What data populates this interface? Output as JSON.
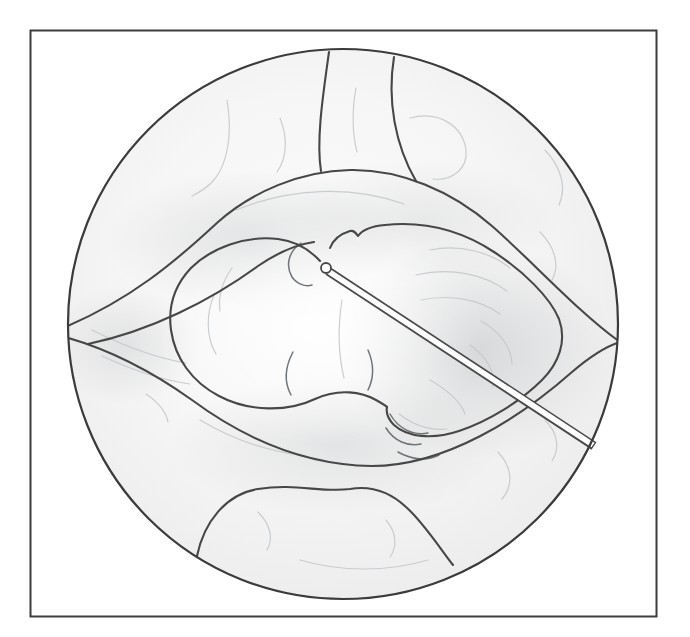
{
  "figure": {
    "kind": "medical-line-illustration",
    "visible_text": "",
    "elements": [
      {
        "name": "outer-frame",
        "role": "figure border rectangle"
      },
      {
        "name": "endoscopic-field-circle",
        "role": "circular scope field of view"
      },
      {
        "name": "peripheral-bowel-loops",
        "role": "lobulated tissue around the field periphery"
      },
      {
        "name": "tissue-ring",
        "role": "oval tissue band surrounding the central organ"
      },
      {
        "name": "central-organ-left-lobe",
        "role": "smooth left lobe of central organ"
      },
      {
        "name": "central-organ-right-lobe",
        "role": "textured right lobe of central organ"
      },
      {
        "name": "puncture-needle",
        "role": "thin instrument shaft entering from lower right"
      },
      {
        "name": "needle-tip",
        "role": "rounded needle tip at organ notch"
      }
    ],
    "colors": {
      "background": "#ffffff",
      "frame_stroke": "#3d3d3d",
      "outline_stroke": "#474747",
      "field_fill_center": "#fbfbfb",
      "field_fill_edge": "#ececed",
      "shading_gray": "#80868c",
      "texture_faint": "#c5c9cc",
      "texture_medium": "#6f7478",
      "needle_fill": "#ffffff"
    }
  }
}
